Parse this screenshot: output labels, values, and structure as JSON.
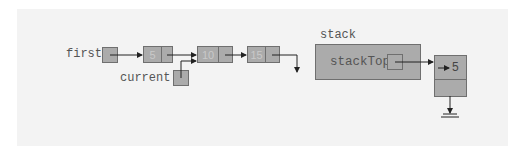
{
  "diagram": {
    "type": "linked-list-and-stack",
    "colors": {
      "background": "#ffffff",
      "panel": "#f3f3f3",
      "node_fill": "#ababab",
      "node_border": "#6f6f6f",
      "text": "#555555",
      "node_value_text": "#c9c9c9",
      "arrow": "#222222"
    },
    "labels": {
      "first": "first",
      "current": "current",
      "stack": "stack",
      "stackTop": "stackTop"
    },
    "list_nodes": [
      {
        "value": "5"
      },
      {
        "value": "10"
      },
      {
        "value": "15"
      }
    ],
    "stack_node": {
      "value": "5",
      "arrow_glyph": "→"
    },
    "pointers": [
      {
        "from": "first",
        "to": "list_nodes.0"
      },
      {
        "from": "list_nodes.0",
        "to": "list_nodes.1"
      },
      {
        "from": "current",
        "to": "list_nodes.1"
      },
      {
        "from": "list_nodes.1",
        "to": "list_nodes.2"
      },
      {
        "from": "list_nodes.2",
        "to": "null"
      },
      {
        "from": "stackTop",
        "to": "stack_node"
      },
      {
        "from": "stack_node",
        "to": "null-ground"
      }
    ]
  }
}
